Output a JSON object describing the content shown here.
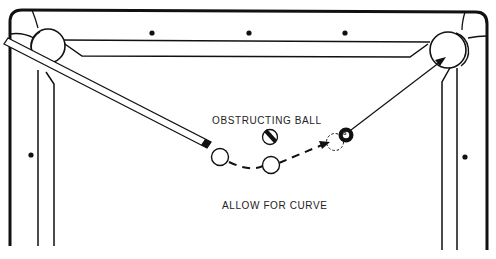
{
  "diagram": {
    "type": "billiards-shot-diagram",
    "labels": {
      "obstructing_ball": "OBSTRUCTING BALL",
      "allow_for_curve": "ALLOW FOR CURVE"
    },
    "object_ball_number": "8",
    "colors": {
      "line": "#111111",
      "background": "#ffffff",
      "text": "#222222"
    }
  }
}
